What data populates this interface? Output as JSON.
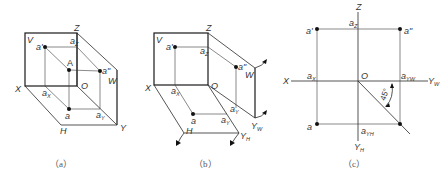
{
  "figure": {
    "panels": [
      {
        "id": "a",
        "caption": "（a）",
        "labels": {
          "V": "V",
          "Z": "Z",
          "X": "X",
          "O": "O",
          "W": "W",
          "H": "H",
          "Y": "Y",
          "A": "A",
          "a_prime": "a'",
          "a_dprime": "a\"",
          "a": "a",
          "a_z": "a",
          "a_z_sub": "Z",
          "a_x": "a",
          "a_x_sub": "X",
          "a_y": "a",
          "a_y_sub": "Y"
        }
      },
      {
        "id": "b",
        "caption": "（b）",
        "labels": {
          "V": "V",
          "Z": "Z",
          "X": "X",
          "O": "O",
          "W": "W",
          "H": "H",
          "Y_W": "Y",
          "Y_W_sub": "W",
          "Y_H": "Y",
          "Y_H_sub": "H",
          "a_prime": "a'",
          "a_dprime": "a\"",
          "a": "a",
          "a_z": "a",
          "a_z_sub": "Z",
          "a_x": "a",
          "a_x_sub": "X",
          "a_yw": "a",
          "a_yw_sub": "Y",
          "a_yh": "a",
          "a_yh_sub": "Y"
        }
      },
      {
        "id": "c",
        "caption": "（c）",
        "labels": {
          "Z": "Z",
          "X": "X",
          "O": "O",
          "Y_W": "Y",
          "Y_W_sub": "W",
          "Y_H": "Y",
          "Y_H_sub": "H",
          "a_prime": "a'",
          "a_dprime": "a\"",
          "a": "a",
          "a_z": "a",
          "a_z_sub": "Z",
          "a_x": "a",
          "a_x_sub": "X",
          "a_yw": "a",
          "a_yw_sub": "YW",
          "a_yh": "a",
          "a_yh_sub": "YH",
          "angle": "45°"
        }
      }
    ]
  }
}
